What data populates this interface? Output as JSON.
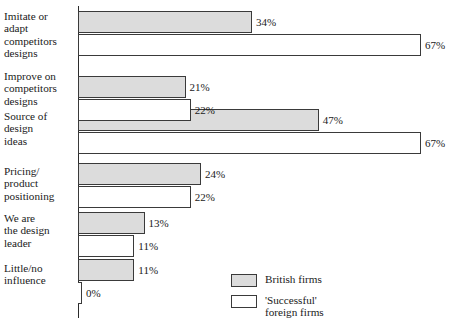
{
  "chart_data": {
    "type": "bar",
    "orientation": "horizontal",
    "title": "",
    "xlabel": "",
    "ylabel": "",
    "grid": false,
    "xlim": [
      0,
      67
    ],
    "legend_position": "bottom-right",
    "categories": [
      "Imitate or adapt competitors designs",
      "Improve on competitors designs",
      "Source of design ideas",
      "Pricing/ product positioning",
      "We are the design leader",
      "Little/no influence"
    ],
    "category_lines": [
      [
        "Imitate or",
        "adapt",
        "competitors",
        "designs"
      ],
      [
        "Improve on",
        "competitors",
        "designs"
      ],
      [
        "Source of",
        "design",
        "ideas"
      ],
      [
        "Pricing/",
        "product",
        "positioning"
      ],
      [
        "We are",
        "the design",
        "leader"
      ],
      [
        "Little/no",
        "influence"
      ]
    ],
    "series": [
      {
        "name": "British firms",
        "color": "#dcdcdc",
        "values": [
          34,
          21,
          47,
          24,
          13,
          11
        ],
        "labels": [
          "34%",
          "21%",
          "47%",
          "24%",
          "13%",
          "11%"
        ]
      },
      {
        "name": "'Successful' foreign firms",
        "color": "#ffffff",
        "values": [
          67,
          22,
          67,
          22,
          11,
          0
        ],
        "labels": [
          "67%",
          "22%",
          "67%",
          "22%",
          "11%",
          "0%"
        ]
      }
    ]
  },
  "legend": {
    "items": [
      {
        "label_lines": [
          "British firms"
        ],
        "swatch": "british"
      },
      {
        "label_lines": [
          "'Successful'",
          "foreign firms"
        ],
        "swatch": "foreign"
      }
    ]
  }
}
